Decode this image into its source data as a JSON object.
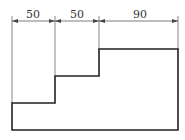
{
  "diagram": {
    "type": "dimensioned-step-profile",
    "colors": {
      "outline": "#222222",
      "dimension": "#444444",
      "background": "#ffffff"
    },
    "dimensions": [
      {
        "label": "50",
        "x1": 12,
        "x2": 55,
        "text_x": 33
      },
      {
        "label": "50",
        "x1": 55,
        "x2": 99,
        "text_x": 77
      },
      {
        "label": "90",
        "x1": 99,
        "x2": 178,
        "text_x": 140
      }
    ],
    "outline_points": "12,103 55,103 55,76 99,76 99,49 178,49 178,130 12,130"
  }
}
